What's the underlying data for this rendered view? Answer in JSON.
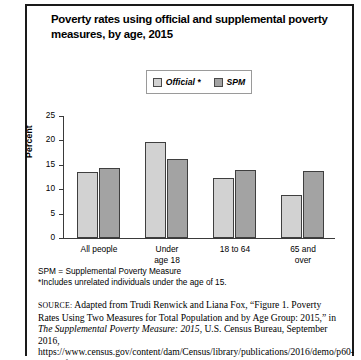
{
  "title": "Poverty rates using official and supplemental poverty measures, by age, 2015",
  "legend": {
    "official": "Official *",
    "spm": "SPM"
  },
  "notes": [
    "SPM = Supplemental Poverty Measure",
    "*Includes unrelated individuals under the age of 15."
  ],
  "source": {
    "prefix": "SOURCE:",
    "part1": " Adapted from Trudi Renwick and Liana Fox, “Figure 1. Poverty Rates Using Two Measures for Total Population and by Age Group: 2015,” in ",
    "italic": "The Supplemental Poverty Measure: 2015",
    "part2": ", U.S. Census Bureau, September 2016, https://www.census.gov/content/dam/Census/library/publications/2016/demo/p60-258.pdf (accessed August"
  },
  "colors": {
    "official": "#d2d2d2",
    "spm": "#a3a3a3",
    "bar_outline": "#3f3f3f",
    "axis": "#3a3a3a"
  },
  "chart_data": {
    "type": "bar",
    "title": "Poverty rates using official and supplemental poverty measures, by age, 2015",
    "xlabel": "",
    "ylabel": "Percent",
    "ylim": [
      0,
      25
    ],
    "yticks": [
      0,
      5,
      10,
      15,
      20,
      25
    ],
    "grid": false,
    "legend_position": "top-center",
    "categories": [
      "All people",
      "Under age 18",
      "18 to 64",
      "65 and over"
    ],
    "category_lines": [
      [
        "All people"
      ],
      [
        "Under",
        "age 18"
      ],
      [
        "18 to 64"
      ],
      [
        "65 and",
        "over"
      ]
    ],
    "series": [
      {
        "name": "Official *",
        "color": "#d2d2d2",
        "values": [
          13.5,
          19.7,
          12.4,
          8.8
        ]
      },
      {
        "name": "SPM",
        "color": "#a3a3a3",
        "values": [
          14.3,
          16.1,
          13.9,
          13.7
        ]
      }
    ]
  }
}
